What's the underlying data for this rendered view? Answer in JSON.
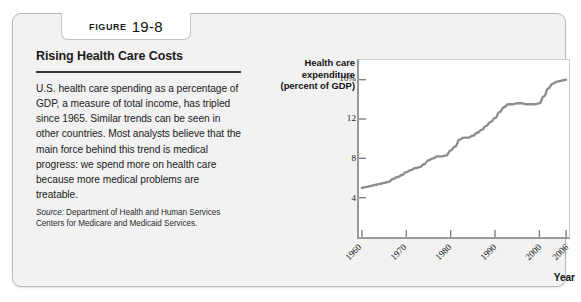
{
  "figure": {
    "label_word": "FIGURE",
    "number": "19-8",
    "title": "Rising Health Care Costs",
    "body": "U.S. health care spending as a percentage of GDP, a measure of total income, has tripled since 1965. Similar trends can be seen in other countries. Most analysts believe that the main force behind this trend is medical progress: we spend more on health care because more medical problems are treatable.",
    "source_word": "Source:",
    "source_text": "Department of Health and Human Services Centers for Medicare and Medicaid Services."
  },
  "chart_data": {
    "type": "line",
    "title": "",
    "ylabel": "Health care expenditure (percent of GDP)",
    "xlabel": "Year",
    "ylim": [
      0,
      18
    ],
    "xlim": [
      1960,
      2006
    ],
    "grid": false,
    "legend": "none",
    "line_color": "#8a8a8a",
    "y_ticks": [
      4,
      8,
      12,
      16
    ],
    "y_tick_labels": [
      "4",
      "8",
      "12",
      "16%"
    ],
    "x_ticks": [
      1960,
      1970,
      1980,
      1990,
      2000,
      2006
    ],
    "x_tick_labels": [
      "1960",
      "1970",
      "1980",
      "1990",
      "2000",
      "2006"
    ],
    "x": [
      1960,
      1961,
      1962,
      1963,
      1964,
      1965,
      1966,
      1967,
      1968,
      1969,
      1970,
      1971,
      1972,
      1973,
      1974,
      1975,
      1976,
      1977,
      1978,
      1979,
      1980,
      1981,
      1982,
      1983,
      1984,
      1985,
      1986,
      1987,
      1988,
      1989,
      1990,
      1991,
      1992,
      1993,
      1994,
      1995,
      1996,
      1997,
      1998,
      1999,
      2000,
      2001,
      2002,
      2003,
      2004,
      2005,
      2006
    ],
    "values": [
      5.0,
      5.1,
      5.2,
      5.3,
      5.4,
      5.5,
      5.6,
      5.9,
      6.1,
      6.3,
      6.6,
      6.8,
      7.0,
      7.1,
      7.4,
      7.8,
      8.0,
      8.2,
      8.2,
      8.3,
      8.8,
      9.2,
      9.9,
      10.1,
      10.1,
      10.3,
      10.6,
      10.9,
      11.3,
      11.7,
      12.1,
      12.7,
      13.2,
      13.5,
      13.5,
      13.6,
      13.6,
      13.5,
      13.5,
      13.5,
      13.6,
      14.3,
      15.1,
      15.6,
      15.8,
      15.9,
      16.0
    ]
  }
}
